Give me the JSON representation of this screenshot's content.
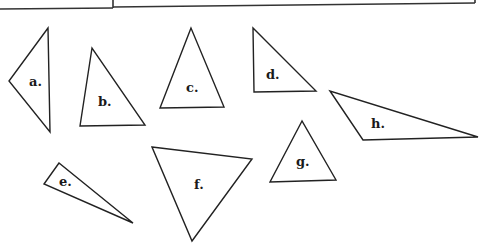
{
  "figure": {
    "stroke_color": "#222222",
    "background": "#ffffff",
    "triangles": [
      {
        "label": "a.",
        "points": "48,28 9,81 50,132",
        "label_pos": [
          29,
          84
        ]
      },
      {
        "label": "b.",
        "points": "92,48 80,126 145,125",
        "label_pos": [
          98,
          106
        ]
      },
      {
        "label": "c.",
        "points": "191,28 160,108 224,107",
        "label_pos": [
          187,
          90
        ]
      },
      {
        "label": "d.",
        "points": "253,28 254,92 316,91",
        "label_pos": [
          266,
          78
        ]
      },
      {
        "label": "e.",
        "points": "59,163 44,184 133,223",
        "label_pos": [
          59,
          186
        ]
      },
      {
        "label": "f.",
        "points": "152,147 252,159 192,241",
        "label_pos": [
          194,
          189
        ]
      },
      {
        "label": "g.",
        "points": "302,121 270,182 336,180",
        "label_pos": [
          297,
          165
        ]
      },
      {
        "label": "h.",
        "points": "330,91 363,140 478,137",
        "label_pos": [
          371,
          128
        ]
      }
    ]
  }
}
